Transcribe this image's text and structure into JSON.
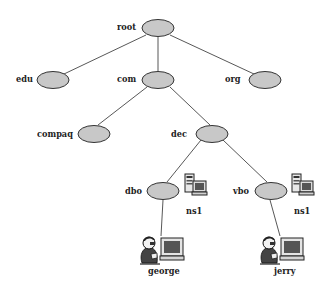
{
  "diagram": {
    "colors": {
      "node_fill": "#c8c8c8",
      "node_stroke": "#333333",
      "edge": "#444444",
      "label": "#222222"
    },
    "nodes": [
      {
        "id": "root",
        "label": "root"
      },
      {
        "id": "edu",
        "label": "edu"
      },
      {
        "id": "com",
        "label": "com"
      },
      {
        "id": "org",
        "label": "org"
      },
      {
        "id": "compaq",
        "label": "compaq"
      },
      {
        "id": "dec",
        "label": "dec"
      },
      {
        "id": "dbo",
        "label": "dbo"
      },
      {
        "id": "vbo",
        "label": "vbo"
      }
    ],
    "servers": [
      {
        "id": "dbo-ns1",
        "label": "ns1",
        "icon": "server-computer-icon"
      },
      {
        "id": "vbo-ns1",
        "label": "ns1",
        "icon": "server-computer-icon"
      }
    ],
    "hosts": [
      {
        "id": "george",
        "label": "george",
        "icon": "user-at-computer-icon"
      },
      {
        "id": "jerry",
        "label": "jerry",
        "icon": "user-at-computer-icon"
      }
    ],
    "edges": [
      [
        "root",
        "edu"
      ],
      [
        "root",
        "com"
      ],
      [
        "root",
        "org"
      ],
      [
        "com",
        "compaq"
      ],
      [
        "com",
        "dec"
      ],
      [
        "dec",
        "dbo"
      ],
      [
        "dec",
        "vbo"
      ],
      [
        "dbo",
        "george"
      ],
      [
        "vbo",
        "jerry"
      ]
    ]
  }
}
